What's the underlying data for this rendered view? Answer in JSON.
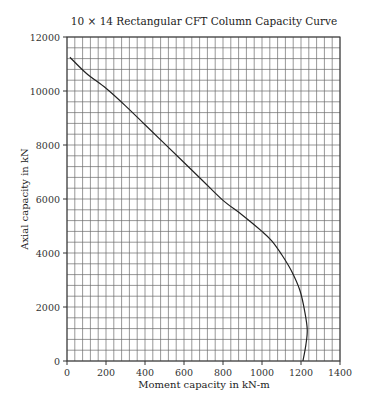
{
  "chart_data": {
    "type": "line",
    "title": "10 × 14 Rectangular CFT Column Capacity Curve",
    "xlabel": "Moment capacity in kN-m",
    "ylabel": "Axial capacity in kN",
    "xlim": [
      0,
      1400
    ],
    "ylim": [
      0,
      12000
    ],
    "xticks": [
      0,
      200,
      400,
      600,
      800,
      1000,
      1200,
      1400
    ],
    "yticks": [
      0,
      2000,
      4000,
      6000,
      8000,
      10000,
      12000
    ],
    "x_minor_step": 40,
    "y_minor_step": 400,
    "grid": true,
    "legend": null,
    "series": [
      {
        "name": "Capacity curve",
        "color": "#222222",
        "points": [
          [
            15,
            11250
          ],
          [
            100,
            10650
          ],
          [
            200,
            10100
          ],
          [
            300,
            9450
          ],
          [
            400,
            8750
          ],
          [
            500,
            8050
          ],
          [
            600,
            7350
          ],
          [
            700,
            6650
          ],
          [
            800,
            5950
          ],
          [
            900,
            5400
          ],
          [
            1000,
            4800
          ],
          [
            1050,
            4450
          ],
          [
            1100,
            3950
          ],
          [
            1150,
            3350
          ],
          [
            1195,
            2600
          ],
          [
            1220,
            1800
          ],
          [
            1232,
            1150
          ],
          [
            1225,
            600
          ],
          [
            1210,
            0
          ]
        ]
      }
    ]
  },
  "colors": {
    "grid": "#6b6b6b",
    "frame": "#333333",
    "curve": "#222222"
  }
}
